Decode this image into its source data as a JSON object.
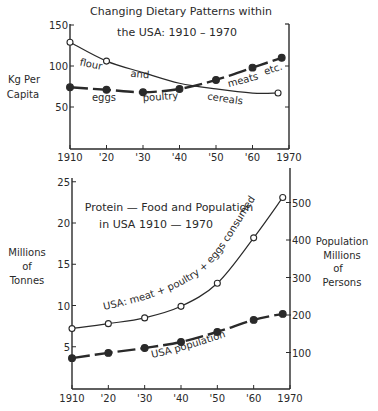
{
  "chart_data": [
    {
      "type": "line",
      "title": "Changing Dietary Patterns within the USA: 1910 - 1970",
      "title_lines": [
        "Changing  Dietary  Patterns within",
        "the USA: 1910 – 1970"
      ],
      "xlabel": "",
      "ylabel": "Kg Per Capita",
      "ylabel_lines": [
        "Kg Per",
        "Capita"
      ],
      "x_tick_labels": [
        "1910",
        "'20",
        "'30",
        "'40",
        "'50",
        "'60",
        "1970"
      ],
      "x_ticks": [
        1910,
        1920,
        1930,
        1940,
        1950,
        1960,
        1970
      ],
      "y_ticks": [
        50,
        100,
        150
      ],
      "ylim": [
        0,
        150
      ],
      "xlim": [
        1910,
        1970
      ],
      "grid": false,
      "legend": "inline annotations",
      "series": [
        {
          "name": "flour and cereals",
          "marker": "open-circle",
          "style": "solid",
          "x": [
            1910,
            1920,
            1967
          ],
          "values": [
            129,
            106,
            67
          ],
          "curve_points": [
            [
              1910,
              129
            ],
            [
              1920,
              106
            ],
            [
              1930,
              92
            ],
            [
              1940,
              79
            ],
            [
              1950,
              72
            ],
            [
              1960,
              67
            ],
            [
              1967,
              67
            ]
          ],
          "annotations": [
            {
              "text": "flour",
              "x": 1912.5,
              "y": 101,
              "rotate": 12
            },
            {
              "text": "and",
              "x": 1926.5,
              "y": 87,
              "rotate": 5
            },
            {
              "text": "cereals",
              "x": 1947.5,
              "y": 59,
              "rotate": 8
            }
          ]
        },
        {
          "name": "eggs poultry meats etc.",
          "marker": "filled-circle",
          "style": "dashed",
          "x": [
            1910,
            1920,
            1930,
            1940,
            1950,
            1960,
            1968
          ],
          "values": [
            74,
            71,
            68,
            72,
            83,
            98,
            110
          ],
          "annotations": [
            {
              "text": "eggs",
              "x": 1916,
              "y": 57,
              "rotate": 0
            },
            {
              "text": "poultry",
              "x": 1930,
              "y": 57,
              "rotate": -4
            },
            {
              "text": "meats",
              "x": 1953.5,
              "y": 74,
              "rotate": -15
            },
            {
              "text": "etc.",
              "x": 1963.5,
              "y": 89,
              "rotate": -18
            }
          ]
        }
      ]
    },
    {
      "type": "line",
      "title": "Protein - Food and Population in USA 1910 - 1970",
      "title_lines": [
        "Protein — Food and Population",
        "in USA  1910 — 1970"
      ],
      "xlabel": "",
      "ylabel": "Millions of Tonnes",
      "ylabel_lines": [
        "Millions",
        "of",
        "Tonnes"
      ],
      "y2label": "Population Millions of Persons",
      "y2label_lines": [
        "Population",
        "Millions",
        "of",
        "Persons"
      ],
      "x_tick_labels": [
        "1910",
        "'20",
        "'30",
        "'40",
        "'50",
        "'60",
        "1970"
      ],
      "x_ticks": [
        1910,
        1920,
        1930,
        1940,
        1950,
        1960,
        1970
      ],
      "y_ticks": [
        5,
        10,
        15,
        20,
        25
      ],
      "y2_ticks": [
        100,
        200,
        300,
        400,
        500
      ],
      "ylim": [
        0,
        25
      ],
      "y2lim": [
        0,
        520
      ],
      "xlim": [
        1910,
        1970
      ],
      "grid": false,
      "legend": "inline annotations",
      "series": [
        {
          "name": "USA: meat + poultry + eggs consumed",
          "axis": "left",
          "marker": "open-circle",
          "style": "solid",
          "x": [
            1910,
            1920,
            1930,
            1940,
            1950,
            1960,
            1968
          ],
          "values": [
            7.2,
            7.8,
            8.5,
            9.9,
            12.7,
            18.2,
            23.1
          ],
          "label_text": "USA: meat + poultry + eggs consumed"
        },
        {
          "name": "USA population",
          "axis": "right",
          "unit": "millions of persons",
          "marker": "filled-circle",
          "style": "dashed",
          "x": [
            1910,
            1920,
            1930,
            1940,
            1950,
            1960,
            1968
          ],
          "values": [
            85,
            99,
            112,
            128,
            155,
            187,
            203
          ],
          "label_text": "USA population"
        }
      ]
    }
  ],
  "colors": {
    "ink": "#2a2a2a",
    "background": "#ffffff"
  }
}
